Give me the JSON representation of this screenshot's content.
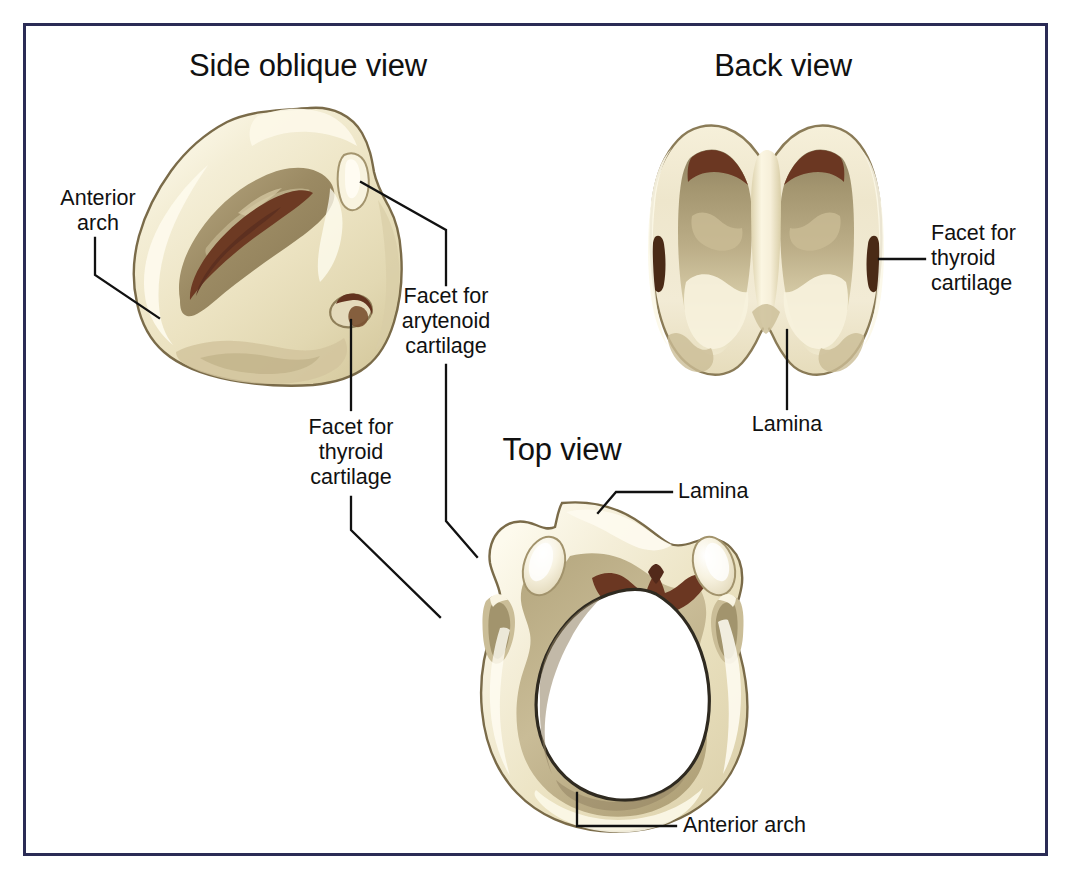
{
  "figure": {
    "border_color": "#2a2b55",
    "background": "#ffffff"
  },
  "palette": {
    "cream_light": "#fbf7e4",
    "cream": "#f1ead0",
    "ivory": "#e9e1c0",
    "tan": "#cdc09c",
    "khaki": "#b6a87f",
    "khaki_dark": "#9d8f69",
    "brown": "#7d5334",
    "maroon": "#6a3622",
    "outline": "#7a6b49",
    "leader": "#111111",
    "text": "#111111"
  },
  "panels": [
    {
      "id": "side-oblique",
      "title": "Side oblique view"
    },
    {
      "id": "back",
      "title": "Back view"
    },
    {
      "id": "top",
      "title": "Top view"
    }
  ],
  "labels": {
    "anterior_arch_left": "Anterior\narch",
    "facet_arytenoid": "Facet for\narytenoid\ncartilage",
    "facet_thyroid_left": "Facet for\nthyroid\ncartilage",
    "facet_thyroid_right": "Facet for\nthyroid\ncartilage",
    "lamina_back": "Lamina",
    "lamina_top": "Lamina",
    "anterior_arch_bottom": "Anterior arch"
  }
}
